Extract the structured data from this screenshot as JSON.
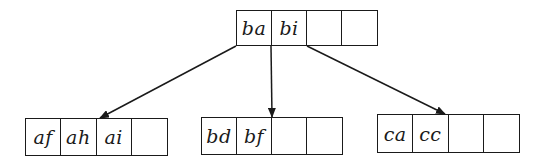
{
  "diagram": {
    "type": "b-tree",
    "colors": {
      "stroke": "#1a1a1a",
      "background": "#ffffff"
    },
    "root": {
      "id": "root",
      "keys": [
        "ba",
        "bi",
        "",
        ""
      ],
      "box": {
        "x": 236,
        "y": 10,
        "cell_w": 35.5,
        "h": 36
      }
    },
    "children": [
      {
        "id": "child-0",
        "keys": [
          "af",
          "ah",
          "ai",
          ""
        ],
        "box": {
          "x": 25,
          "y": 118,
          "cell_w": 35.75,
          "h": 38
        }
      },
      {
        "id": "child-1",
        "keys": [
          "bd",
          "bf",
          "",
          ""
        ],
        "box": {
          "x": 201,
          "y": 117,
          "cell_w": 35.5,
          "h": 38
        }
      },
      {
        "id": "child-2",
        "keys": [
          "ca",
          "cc",
          "",
          ""
        ],
        "box": {
          "x": 377,
          "y": 114,
          "cell_w": 35.75,
          "h": 39
        }
      }
    ],
    "edges": [
      {
        "from": "root",
        "to": "child-0",
        "x1": 236,
        "y1": 46,
        "x2": 100,
        "y2": 118
      },
      {
        "from": "root",
        "to": "child-1",
        "x1": 271,
        "y1": 46,
        "x2": 272,
        "y2": 117
      },
      {
        "from": "root",
        "to": "child-2",
        "x1": 307,
        "y1": 46,
        "x2": 445,
        "y2": 114
      }
    ]
  }
}
